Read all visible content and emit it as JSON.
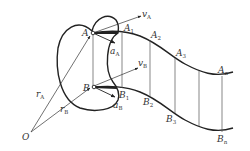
{
  "figure": {
    "colors": {
      "stroke": "#222222",
      "thin": "#444444",
      "background": "#ffffff"
    }
  },
  "points": {
    "origin": {
      "label": "O"
    },
    "A": {
      "label": "A"
    },
    "B": {
      "label": "B"
    }
  },
  "vectors": {
    "rA": {
      "main": "r",
      "sub": "A"
    },
    "rB": {
      "main": "r",
      "sub": "B"
    },
    "vA": {
      "main": "v",
      "sub": "A"
    },
    "vB": {
      "main": "v",
      "sub": "B"
    },
    "aA": {
      "main": "a",
      "sub": "A"
    },
    "aB": {
      "main": "a",
      "sub": "B"
    }
  },
  "path_A": [
    {
      "main": "A",
      "sub": "1"
    },
    {
      "main": "A",
      "sub": "2"
    },
    {
      "main": "A",
      "sub": "3"
    },
    {
      "main": "A",
      "sub": "n"
    }
  ],
  "path_B": [
    {
      "main": "B",
      "sub": "1"
    },
    {
      "main": "B",
      "sub": "2"
    },
    {
      "main": "B",
      "sub": "3"
    },
    {
      "main": "B",
      "sub": "n"
    }
  ]
}
